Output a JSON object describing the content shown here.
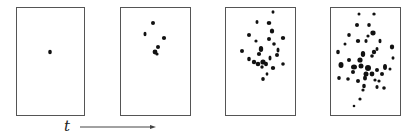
{
  "figure": {
    "axis_label": "t",
    "arrow": {
      "x1": 80,
      "x2": 155,
      "y": 127
    },
    "panels": [
      {
        "x": 16,
        "y": 7,
        "w": 68,
        "h": 108,
        "dots": [
          [
            50,
            52,
            1.8,
            2.3
          ]
        ]
      },
      {
        "x": 120,
        "y": 7,
        "w": 70,
        "h": 108,
        "dots": [
          [
            153,
            23,
            2,
            2
          ],
          [
            145,
            34,
            1.5,
            2.2
          ],
          [
            164,
            38,
            2.1,
            2.1
          ],
          [
            158,
            47,
            2,
            2
          ],
          [
            155,
            52,
            2.4,
            2.4
          ],
          [
            157,
            54,
            1.6,
            1.6
          ]
        ]
      },
      {
        "x": 225,
        "y": 7,
        "w": 70,
        "h": 108,
        "dots": [
          [
            273,
            12,
            1.5,
            1.8
          ],
          [
            257,
            22,
            1.5,
            2
          ],
          [
            269,
            23,
            2.3,
            2
          ],
          [
            272,
            31,
            2.2,
            2.5
          ],
          [
            249,
            35,
            2,
            2
          ],
          [
            283,
            38,
            2.2,
            2.1
          ],
          [
            269,
            39,
            2,
            2.1
          ],
          [
            256,
            41,
            1.6,
            1.6
          ],
          [
            274,
            44,
            1.8,
            1.8
          ],
          [
            278,
            50,
            1.5,
            2.5
          ],
          [
            261,
            49,
            2.2,
            3
          ],
          [
            242,
            51,
            2,
            2
          ],
          [
            259,
            54,
            2.1,
            2.1
          ],
          [
            277,
            55,
            2,
            2
          ],
          [
            249,
            59,
            1.8,
            2.2
          ],
          [
            270,
            58,
            1.5,
            2.5
          ],
          [
            254,
            62,
            2.2,
            2.2
          ],
          [
            263,
            62,
            2.6,
            2.6
          ],
          [
            258,
            64,
            2.3,
            2.3
          ],
          [
            266,
            64,
            2,
            2.2
          ],
          [
            283,
            64,
            1.8,
            1.8
          ],
          [
            262,
            67,
            1.7,
            1.7
          ],
          [
            273,
            68,
            2.2,
            2.1
          ],
          [
            267,
            74,
            1.4,
            1.8
          ],
          [
            263,
            79,
            1.8,
            2
          ]
        ]
      },
      {
        "x": 330,
        "y": 7,
        "w": 70,
        "h": 108,
        "dots": [
          [
            359,
            14,
            1.5,
            1.5
          ],
          [
            374,
            14,
            1.7,
            1.5
          ],
          [
            357,
            25,
            2,
            2
          ],
          [
            369,
            25,
            1.8,
            2
          ],
          [
            373,
            33,
            2.6,
            2.4
          ],
          [
            349,
            35,
            1.8,
            2
          ],
          [
            368,
            36,
            1.6,
            1.6
          ],
          [
            366,
            41,
            1.6,
            2
          ],
          [
            358,
            41,
            2.2,
            2
          ],
          [
            345,
            44,
            1.5,
            1.5
          ],
          [
            380,
            41,
            1.5,
            2.2
          ],
          [
            392,
            47,
            2.2,
            2.4
          ],
          [
            377,
            49,
            1.5,
            2
          ],
          [
            374,
            52,
            2.2,
            2.2
          ],
          [
            338,
            52,
            1.8,
            2.2
          ],
          [
            363,
            54,
            2.2,
            3
          ],
          [
            372,
            56,
            1.8,
            1.8
          ],
          [
            393,
            58,
            1.5,
            1.8
          ],
          [
            349,
            60,
            2,
            2
          ],
          [
            360,
            60,
            2.6,
            2.6
          ],
          [
            341,
            65,
            2.5,
            3
          ],
          [
            354,
            67,
            3,
            2.5
          ],
          [
            361,
            66,
            2.5,
            2.5
          ],
          [
            368,
            68,
            3,
            3
          ],
          [
            377,
            70,
            2,
            2
          ],
          [
            385,
            67,
            2,
            3
          ],
          [
            390,
            69,
            1.5,
            1.5
          ],
          [
            353,
            72,
            2,
            2
          ],
          [
            366,
            74,
            2.5,
            2.5
          ],
          [
            372,
            74,
            2.4,
            2.4
          ],
          [
            382,
            74,
            2,
            2
          ],
          [
            339,
            78,
            1.8,
            2
          ],
          [
            348,
            79,
            1.8,
            1.8
          ],
          [
            358,
            81,
            2,
            2
          ],
          [
            365,
            78,
            2,
            2.5
          ],
          [
            375,
            80,
            1.6,
            1.6
          ],
          [
            379,
            81,
            1.6,
            1.6
          ],
          [
            364,
            86,
            1.8,
            2.2
          ],
          [
            363,
            90,
            1.6,
            1.6
          ],
          [
            377,
            87,
            1.6,
            2
          ],
          [
            384,
            88,
            1.8,
            1.8
          ],
          [
            360,
            99,
            1.6,
            1.6
          ],
          [
            354,
            106,
            1.3,
            1.3
          ]
        ]
      }
    ]
  }
}
